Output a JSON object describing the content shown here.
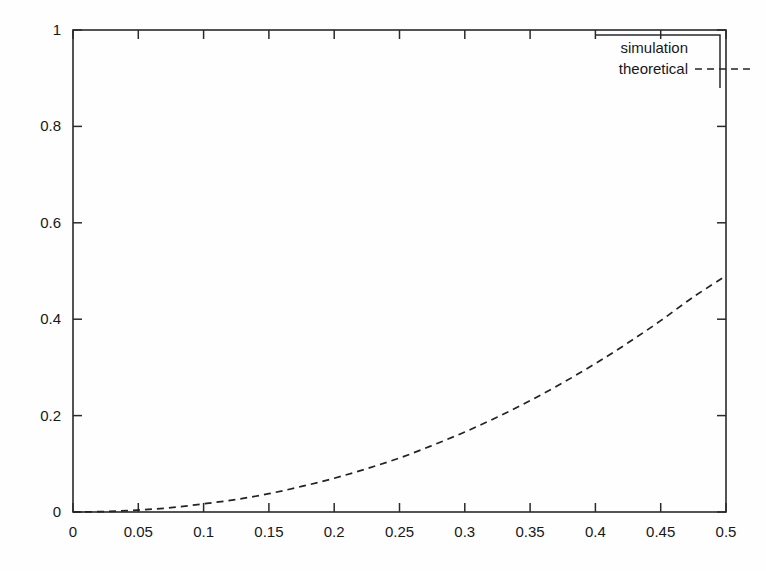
{
  "chart_data": {
    "type": "line",
    "title": "",
    "subtitle": "",
    "xlabel": "",
    "ylabel": "",
    "xlim": [
      0,
      0.5
    ],
    "ylim": [
      0,
      1
    ],
    "grid": false,
    "legend_position": "top-right inside plot frame",
    "x_ticks": [
      "0",
      "0.05",
      "0.1",
      "0.15",
      "0.2",
      "0.25",
      "0.3",
      "0.35",
      "0.4",
      "0.45",
      "0.5"
    ],
    "x_tick_values": [
      0,
      0.05,
      0.1,
      0.15,
      0.2,
      0.25,
      0.3,
      0.35,
      0.4,
      0.45,
      0.5
    ],
    "y_ticks": [
      "0",
      "0.2",
      "0.4",
      "0.6",
      "0.8",
      "1"
    ],
    "y_tick_values": [
      0,
      0.2,
      0.4,
      0.6,
      0.8,
      1
    ],
    "legend": [
      {
        "label": "simulation",
        "style": "points",
        "sample_visible": false
      },
      {
        "label": "theoretical",
        "style": "dashed-line",
        "sample_visible": true
      }
    ],
    "series": [
      {
        "name": "simulation",
        "style": "points",
        "x": [],
        "values": []
      },
      {
        "name": "theoretical",
        "style": "dashed",
        "x": [
          0,
          0.025,
          0.05,
          0.075,
          0.1,
          0.125,
          0.15,
          0.175,
          0.2,
          0.225,
          0.25,
          0.275,
          0.3,
          0.325,
          0.35,
          0.375,
          0.4,
          0.425,
          0.45,
          0.475,
          0.5
        ],
        "values": [
          0.0,
          0.001,
          0.004,
          0.009,
          0.017,
          0.026,
          0.038,
          0.053,
          0.07,
          0.09,
          0.112,
          0.138,
          0.166,
          0.197,
          0.231,
          0.268,
          0.308,
          0.351,
          0.397,
          0.446,
          0.49
        ]
      }
    ],
    "annotations": []
  },
  "legend": {
    "simulation_label": "simulation",
    "theoretical_label": "theoretical"
  },
  "colors": {
    "axis": "#2a2a2c",
    "curve": "#232325",
    "background": "#fefefe"
  }
}
